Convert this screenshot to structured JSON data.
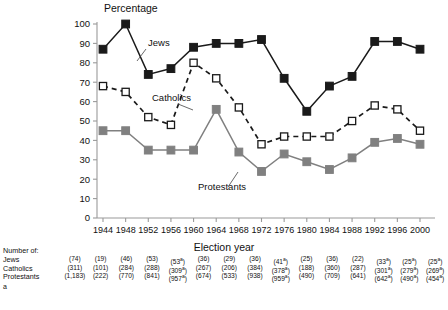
{
  "chart_data": {
    "type": "line",
    "title": "",
    "ylabel": "Percentage",
    "xlabel": "Election year",
    "ylim": [
      0,
      100
    ],
    "yticks": [
      0,
      10,
      20,
      30,
      40,
      50,
      60,
      70,
      80,
      90,
      100
    ],
    "grid": false,
    "legend": "inline-annotations",
    "categories": [
      1944,
      1948,
      1952,
      1956,
      1960,
      1964,
      1968,
      1972,
      1976,
      1980,
      1984,
      1988,
      1992,
      1996,
      2000
    ],
    "series": [
      {
        "name": "Jews",
        "marker": "filled-square",
        "color": "#1a1a1a",
        "linestyle": "solid",
        "values": [
          87,
          100,
          74,
          77,
          88,
          90,
          90,
          92,
          72,
          55,
          68,
          73,
          91,
          91,
          87
        ]
      },
      {
        "name": "Catholics",
        "marker": "open-square",
        "color": "#1a1a1a",
        "linestyle": "dashed",
        "values": [
          68,
          65,
          52,
          48,
          80,
          72,
          57,
          38,
          42,
          42,
          42,
          50,
          58,
          56,
          45
        ]
      },
      {
        "name": "Protestants",
        "marker": "filled-square-gray",
        "color": "#808080",
        "linestyle": "solid",
        "values": [
          45,
          45,
          35,
          35,
          35,
          56,
          34,
          24,
          33,
          29,
          25,
          31,
          39,
          41,
          38
        ]
      }
    ]
  },
  "axis_titles": {
    "y": "Percentage",
    "x": "Election year"
  },
  "series_annotations": [
    {
      "label": "Jews"
    },
    {
      "label": "Catholics"
    },
    {
      "label": "Protestants"
    }
  ],
  "numbers_table": {
    "header": "Number of:",
    "footnote_symbol": "a",
    "rows": [
      {
        "label": "Jews",
        "values": [
          "(74)",
          "(19)",
          "(46)",
          "(53)",
          "(53)",
          "(36)",
          "(29)",
          "(36)",
          "(41)",
          "(25)",
          "(36)",
          "(22)",
          "(33)",
          "(25)",
          "(25)"
        ],
        "footnotes": [
          "",
          "",
          "",
          "",
          "a",
          "",
          "",
          "",
          "a",
          "",
          "",
          "",
          "a",
          "a",
          "a"
        ]
      },
      {
        "label": "Catholics",
        "values": [
          "(311)",
          "(101)",
          "(284)",
          "(288)",
          "(309)",
          "(267)",
          "(206)",
          "(384)",
          "(378)",
          "(188)",
          "(360)",
          "(287)",
          "(301)",
          "(279)",
          "(269)"
        ],
        "footnotes": [
          "",
          "",
          "",
          "",
          "a",
          "",
          "",
          "",
          "a",
          "",
          "",
          "",
          "a",
          "a",
          "a"
        ]
      },
      {
        "label": "Protestants",
        "values": [
          "(1,183)",
          "(222)",
          "(770)",
          "(841)",
          "(957)",
          "(674)",
          "(533)",
          "(938)",
          "(959)",
          "(490)",
          "(709)",
          "(641)",
          "(642)",
          "(490)",
          "(454)"
        ],
        "footnotes": [
          "",
          "",
          "",
          "",
          "a",
          "",
          "",
          "",
          "a",
          "",
          "",
          "",
          "a",
          "a",
          "a"
        ]
      }
    ]
  },
  "colors": {
    "jews": "#1a1a1a",
    "catholics": "#1a1a1a",
    "protestants": "#808080",
    "axis": "#9a9a9a",
    "background": "#ffffff"
  }
}
